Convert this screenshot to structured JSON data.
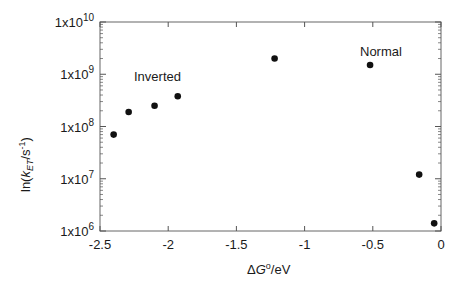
{
  "chart_data": {
    "type": "scatter",
    "title": "",
    "xlabel": "ΔG°/eV",
    "ylabel": "ln(kET/s-1)",
    "xlim": [
      -2.5,
      0
    ],
    "ylim": [
      1000000.0,
      10000000000.0
    ],
    "yscale": "log",
    "grid": false,
    "legend": null,
    "x_ticks": [
      -2.5,
      -2,
      -1.5,
      -1,
      -0.5,
      0
    ],
    "x_tick_labels": [
      "-2.5",
      "-2",
      "-1.5",
      "-1",
      "-0.5",
      "0"
    ],
    "y_ticks": [
      1000000.0,
      10000000.0,
      100000000.0,
      1000000000.0,
      10000000000.0
    ],
    "y_tick_labels": [
      {
        "base": "1x10",
        "exp": "6"
      },
      {
        "base": "1x10",
        "exp": "7"
      },
      {
        "base": "1x10",
        "exp": "8"
      },
      {
        "base": "1x10",
        "exp": "9"
      },
      {
        "base": "1x10",
        "exp": "10"
      }
    ],
    "series": [
      {
        "name": "kET",
        "x": [
          -2.4,
          -2.29,
          -2.1,
          -1.93,
          -1.22,
          -0.52,
          -0.16,
          -0.05
        ],
        "y": [
          70000000.0,
          190000000.0,
          250000000.0,
          380000000.0,
          2000000000.0,
          1500000000.0,
          12000000.0,
          1400000.0
        ]
      }
    ],
    "annotations": [
      {
        "text": "Inverted",
        "x": -2.08,
        "y": 700000000.0
      },
      {
        "text": "Normal",
        "x": -0.45,
        "y": 3000000000.0
      }
    ]
  },
  "labels": {
    "xlabel_delta": "Δ",
    "xlabel_G": "G",
    "xlabel_sup": "o",
    "xlabel_unit": "/eV",
    "ylabel_pre": "ln(",
    "ylabel_k": "k",
    "ylabel_sub": "ET",
    "ylabel_mid": "/s",
    "ylabel_sup": "-1",
    "ylabel_post": ")",
    "annotation_inverted": "Inverted",
    "annotation_normal": "Normal"
  },
  "colors": {
    "marker": "#111111",
    "axis": "#555555",
    "text": "#1a1a1a"
  }
}
